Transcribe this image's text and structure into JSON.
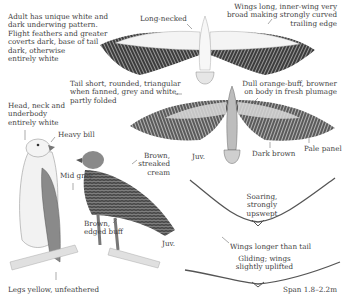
{
  "plate": {
    "background": "#ffffff",
    "ink": "#404040",
    "labels": {
      "adult_description": "Adult has unique white and\ndark underwing pattern.\nFlight feathers and greater\ncoverts dark, base of tail\ndark, otherwise\nentirely white",
      "long_necked": "Long-necked",
      "wings_long": "Wings long, inner-wing very\nbroad making strongly curved\ntrailing edge",
      "tail_short": "Tail short, rounded, triangular\nwhen fanned, grey and white,\npartly folded",
      "dull_orange": "Dull orange-buff, browner\non body in fresh plumage",
      "head_neck": "Head, neck and\nunderbody\nentirely white",
      "heavy_bill": "Heavy bill",
      "juv_flight": "Juv.",
      "dark_brown": "Dark brown",
      "pale_panel": "Pale panel",
      "brown_streaked": "Brown,\nstreaked\ncream",
      "mid_grey": "Mid grey",
      "soaring": "Soaring, strongly\nupswept",
      "brown_edged": "Brown,\nedged buff",
      "juv_perched": "Juv.",
      "wings_longer": "Wings longer than tail",
      "gliding": "Gliding; wings\nslightly uplifted",
      "legs": "Legs yellow, unfeathered",
      "span": "Span 1.8–2.2m"
    }
  }
}
